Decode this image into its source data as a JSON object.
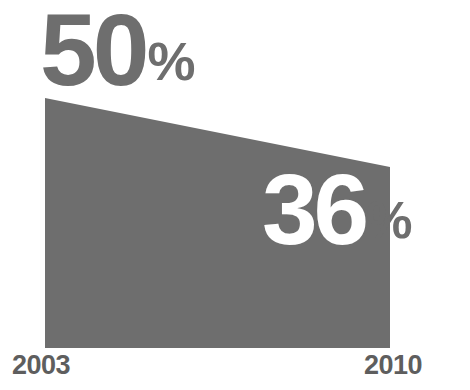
{
  "chart_data": {
    "type": "area",
    "title": "",
    "subtitle": "",
    "xlabel": "",
    "ylabel": "",
    "categories": [
      "2003",
      "2010"
    ],
    "x": [
      2003,
      2010
    ],
    "values": [
      50,
      36
    ],
    "unit": "%",
    "data_labels": [
      "50%",
      "36%"
    ],
    "series": [
      {
        "name": "",
        "values": [
          50,
          36
        ]
      }
    ],
    "ylim": [
      0,
      50
    ],
    "grid": false,
    "legend": false,
    "legend_position": "none",
    "annotations": []
  },
  "shape": {
    "fill_color": "#6e6e6e",
    "left_x": 45,
    "right_x": 390,
    "top_left_y": 98,
    "top_right_y": 167,
    "bottom_y": 348
  },
  "start_point": {
    "value": "50",
    "unit": "%",
    "color": "#6e6e6e"
  },
  "end_point": {
    "value": "36",
    "unit": "%",
    "value_color": "#ffffff",
    "unit_color": "#6e6e6e"
  },
  "axis": {
    "start_year": "2003",
    "end_year": "2010",
    "label_color": "#5e5e5e"
  },
  "background": {
    "color": "#ffffff"
  }
}
